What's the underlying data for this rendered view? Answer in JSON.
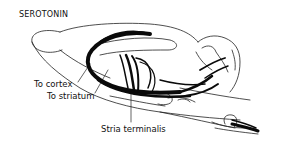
{
  "figure": {
    "title": "SEROTONIN",
    "labels": {
      "to_cortex": "To cortex",
      "to_striatum": "To striatum",
      "stria_terminalis": "Stria terminalis"
    },
    "colors": {
      "background": "#ffffff",
      "ink": "#111111"
    }
  }
}
